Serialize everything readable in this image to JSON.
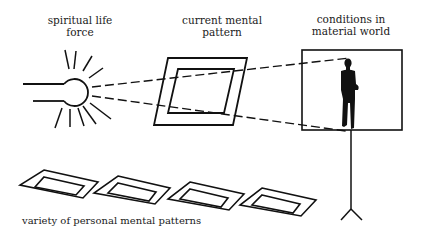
{
  "diagram": {
    "labels": {
      "spiritual_life_force": {
        "line1": "spiritual life",
        "line2": "force"
      },
      "current_mental_pattern": {
        "line1": "current mental",
        "line2": "pattern"
      },
      "conditions_in_material_world": {
        "line1": "conditions in",
        "line2": "material world"
      },
      "variety_of_patterns": "variety of personal mental patterns"
    },
    "elements": {
      "light_source": "lamp-with-rays-icon",
      "current_pattern": "parallelogram-frame",
      "projection_beams": "dashed-lines",
      "screen": "projection-screen-on-tripod",
      "figure": "human-silhouette-icon",
      "pattern_variants_count": 4
    },
    "colors": {
      "ink": "#111111",
      "background": "#ffffff"
    }
  }
}
